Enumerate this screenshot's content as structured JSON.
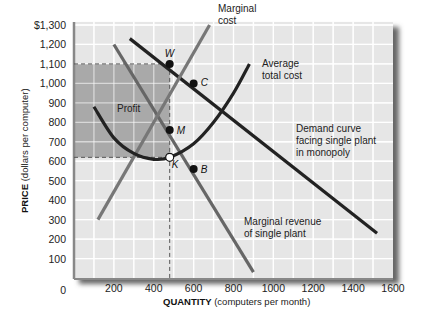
{
  "chart_data": {
    "type": "line",
    "title": "",
    "xlabel": "QUANTITY",
    "xlabel_unit": "(computers per month)",
    "ylabel": "PRICE",
    "ylabel_unit": "(dollars per computer)",
    "xlim": [
      0,
      1600
    ],
    "ylim": [
      0,
      1300
    ],
    "grid": true,
    "x_ticks": [
      "0",
      "200",
      "400",
      "600",
      "800",
      "1000",
      "1200",
      "1400",
      "1600"
    ],
    "y_ticks": [
      "$1,300",
      "1,200",
      "1,100",
      "1,000",
      "900",
      "800",
      "700",
      "600",
      "500",
      "400",
      "300",
      "100"
    ],
    "y_ticks_all": [
      "100",
      "200",
      "300",
      "400",
      "500",
      "600",
      "700",
      "800",
      "900",
      "1,000",
      "1,100",
      "1,200",
      "$1,300"
    ],
    "series": [
      {
        "name": "Demand curve facing single plant in monopoly",
        "label_lines": [
          "Demand curve",
          "facing single plant",
          "in monopoly"
        ],
        "color": "#222222",
        "points": [
          [
            280,
            1230
          ],
          [
            1520,
            230
          ]
        ]
      },
      {
        "name": "Marginal revenue of single plant",
        "label_lines": [
          "Marginal revenue",
          "of single plant"
        ],
        "color": "#666666",
        "points": [
          [
            200,
            1200
          ],
          [
            900,
            30
          ]
        ]
      },
      {
        "name": "Marginal cost",
        "label_lines": [
          "Marginal",
          "cost"
        ],
        "color": "#777777",
        "points": [
          [
            120,
            300
          ],
          [
            680,
            1300
          ]
        ]
      },
      {
        "name": "Average total cost",
        "label_lines": [
          "Average",
          "total cost"
        ],
        "color": "#222222",
        "points": [
          [
            100,
            880
          ],
          [
            200,
            720
          ],
          [
            300,
            640
          ],
          [
            400,
            610
          ],
          [
            480,
            620
          ],
          [
            600,
            690
          ],
          [
            700,
            800
          ],
          [
            800,
            950
          ],
          [
            880,
            1100
          ]
        ]
      }
    ],
    "points": [
      {
        "label": "W",
        "x": 480,
        "y": 1100,
        "fill": "#111"
      },
      {
        "label": "C",
        "x": 600,
        "y": 1000,
        "fill": "#111"
      },
      {
        "label": "M",
        "x": 480,
        "y": 760,
        "fill": "#111"
      },
      {
        "label": "K",
        "x": 480,
        "y": 620,
        "fill": "#fff"
      },
      {
        "label": "B",
        "x": 600,
        "y": 560,
        "fill": "#111"
      }
    ],
    "profit_region": {
      "label": "Profit",
      "x0": 0,
      "x1": 480,
      "y0": 620,
      "y1": 1100
    },
    "dashed_lines": [
      {
        "from": [
          0,
          1100
        ],
        "to": [
          480,
          1100
        ]
      },
      {
        "from": [
          0,
          620
        ],
        "to": [
          480,
          620
        ]
      },
      {
        "vertical_x": 480
      }
    ]
  },
  "labels": {
    "profit": "Profit",
    "marginal_cost": [
      "Marginal",
      "cost"
    ],
    "average_total_cost": [
      "Average",
      "total cost"
    ],
    "demand": [
      "Demand curve",
      "facing single plant",
      "in monopoly"
    ],
    "marginal_revenue": [
      "Marginal revenue",
      "of single plant"
    ],
    "xaxis_title": "QUANTITY",
    "xaxis_unit": " (computers per month)",
    "yaxis_title": "PRICE",
    "yaxis_unit": " (dollars per computer)"
  }
}
